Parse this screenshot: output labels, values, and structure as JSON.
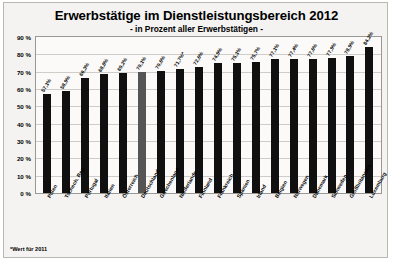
{
  "chart_data": {
    "type": "bar",
    "title": "Erwerbstätige im Dienstleistungsbereich 2012",
    "subtitle": "- in Prozent aller Erwerbstätigen -",
    "xlabel": "",
    "ylabel": "",
    "ylim": [
      0,
      90
    ],
    "grid": true,
    "legend": "none",
    "footnote": "*Wert für 2011",
    "ytick_labels": [
      "90 %",
      "80 %",
      "70 %",
      "60 %",
      "50 %",
      "40 %",
      "30 %",
      "20 %",
      "10 %",
      "0 %"
    ],
    "ytick_values": [
      90,
      80,
      70,
      60,
      50,
      40,
      30,
      20,
      10,
      0
    ],
    "categories": [
      "Polen",
      "Tschech. Rep.",
      "Portugal",
      "Italien",
      "Österreich",
      "Deutschland",
      "Griechenland",
      "Niederlande",
      "Finnland",
      "Frankreich",
      "Spanien",
      "Irland",
      "Belgien",
      "Norwegen",
      "Dänemark",
      "Schweden",
      "Großbritannien",
      "Luxemburg"
    ],
    "bars": [
      {
        "category": "Polen",
        "value": 57.1,
        "label": "57,1%",
        "highlight": false
      },
      {
        "category": "Tschech. Rep.",
        "value": 58.9,
        "label": "58,9%",
        "highlight": false
      },
      {
        "category": "Portugal",
        "value": 66.3,
        "label": "66,3%",
        "highlight": false
      },
      {
        "category": "Italien",
        "value": 68.8,
        "label": "68,8%",
        "highlight": false
      },
      {
        "category": "Österreich",
        "value": 69.2,
        "label": "69,2%",
        "highlight": false
      },
      {
        "category": "Deutschland",
        "value": 70.1,
        "label": "70,1%",
        "highlight": true
      },
      {
        "category": "Griechenland",
        "value": 70.6,
        "label": "70,6%",
        "highlight": false
      },
      {
        "category": "Niederlande",
        "value": 71.7,
        "label": "71,7%*",
        "highlight": false
      },
      {
        "category": "Finnland",
        "value": 72.6,
        "label": "72,6%",
        "highlight": false
      },
      {
        "category": "Frankreich",
        "value": 74.9,
        "label": "74,9%",
        "highlight": false
      },
      {
        "category": "Spanien",
        "value": 75.1,
        "label": "75,1%",
        "highlight": false
      },
      {
        "category": "Irland",
        "value": 75.7,
        "label": "75,7%",
        "highlight": false
      },
      {
        "category": "Belgien",
        "value": 77.1,
        "label": "77,1%",
        "highlight": false
      },
      {
        "category": "Norwegen",
        "value": 77.4,
        "label": "77,4%",
        "highlight": false
      },
      {
        "category": "Dänemark",
        "value": 77.6,
        "label": "77,6%",
        "highlight": false
      },
      {
        "category": "Schweden",
        "value": 77.9,
        "label": "77,9%",
        "highlight": false
      },
      {
        "category": "Großbritannien",
        "value": 78.9,
        "label": "78,9%",
        "highlight": false
      },
      {
        "category": "Luxemburg",
        "value": 84.2,
        "label": "84,2%",
        "highlight": false
      }
    ],
    "colors": {
      "bar": "#101010",
      "bar_highlight": "#555555",
      "background": "#f4f3f1",
      "plot_background": "#fbfaf9",
      "grid": "#cfcdc9",
      "text": "#000000"
    }
  }
}
